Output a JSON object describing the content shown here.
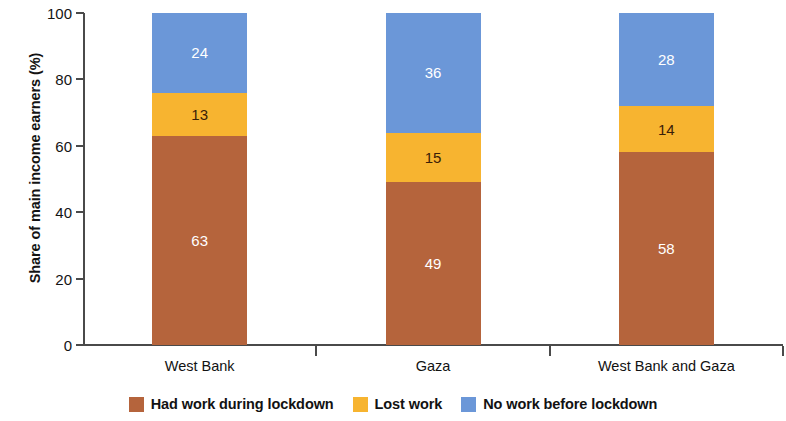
{
  "chart_data": {
    "type": "bar",
    "subtype": "stacked-column-100",
    "title": "",
    "xlabel": "",
    "ylabel": "Share of main income earners (%)",
    "ylim": [
      0,
      100
    ],
    "yticks": [
      0,
      20,
      40,
      60,
      80,
      100
    ],
    "ytick_labels": [
      "0",
      "20",
      "40",
      "60",
      "80",
      "100"
    ],
    "grid": false,
    "legend_position": "bottom-center",
    "categories": [
      "West Bank",
      "Gaza",
      "West Bank and Gaza"
    ],
    "series": [
      {
        "name": "Had work during lockdown",
        "color": "#b5643c",
        "label_color": "#ffffff",
        "values": [
          63,
          49,
          58
        ]
      },
      {
        "name": "Lost work",
        "color": "#f7b430",
        "label_color": "#3a2008",
        "values": [
          13,
          15,
          14
        ]
      },
      {
        "name": "No work before lockdown",
        "color": "#6b97d8",
        "label_color": "#ffffff",
        "values": [
          24,
          36,
          28
        ]
      }
    ]
  },
  "colors": {
    "had_work": "#b5643c",
    "lost_work": "#f7b430",
    "no_work": "#6b97d8",
    "axis": "#4a4a4a",
    "text": "#121212",
    "background": "#ffffff"
  }
}
